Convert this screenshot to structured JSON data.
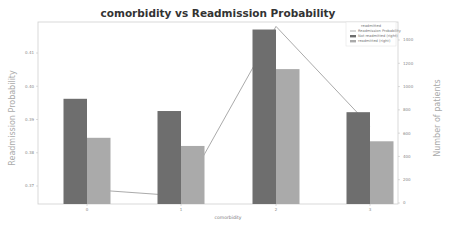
{
  "chart_data": {
    "type": "bar",
    "title": "comorbidity vs Readmission Probability",
    "xlabel": "comorbidity",
    "ylabel": "Readmission Probability",
    "ylabel_right": "Number of patients",
    "categories": [
      "0",
      "1",
      "2",
      "3"
    ],
    "series": [
      {
        "name": "Not readmitted (right)",
        "type": "bar",
        "axis": "right",
        "color": "#6e6e6e",
        "values": [
          895,
          790,
          1490,
          780
        ]
      },
      {
        "name": "readmitted (right)",
        "type": "bar",
        "axis": "right",
        "color": "#aaaaaa",
        "values": [
          560,
          490,
          1150,
          530
        ]
      },
      {
        "name": "Readmission Probability",
        "type": "line",
        "axis": "left",
        "color": "#999999",
        "values": [
          0.369,
          0.367,
          0.418,
          0.388
        ]
      }
    ],
    "ylim_left": [
      0.365,
      0.419
    ],
    "yticks_left": [
      "0.37",
      "0.38",
      "0.39",
      "0.40",
      "0.41"
    ],
    "ylim_right": [
      0,
      1500
    ],
    "yticks_right": [
      "0",
      "200",
      "400",
      "600",
      "800",
      "1000",
      "1200",
      "1400"
    ],
    "legend": {
      "title": "readmitted",
      "position": "upper right",
      "entries": [
        "Readmission Probability",
        "Not readmitted (right)",
        "readmitted (right)"
      ]
    },
    "grid": false
  }
}
